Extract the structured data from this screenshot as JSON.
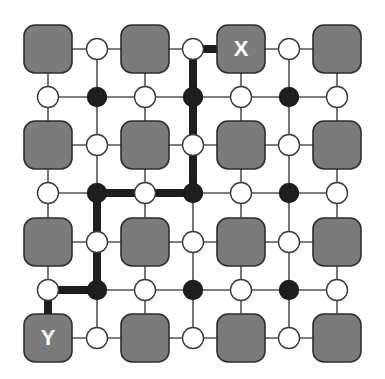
{
  "diagram": {
    "colors": {
      "background": "#ffffff",
      "block_fill": "#7b7b7b",
      "block_stroke": "#2e2e2e",
      "grid_line": "#555555",
      "path": "#1e1e1e",
      "node_white": "#ffffff",
      "node_black": "#1e1e1e",
      "label": "#ffffff"
    },
    "grid_x": [
      48,
      97,
      145,
      193,
      241,
      289,
      337
    ],
    "grid_y": [
      49,
      97,
      145,
      193,
      242,
      290,
      338
    ],
    "blocks": [
      {
        "col": 0,
        "row": 0,
        "label": ""
      },
      {
        "col": 2,
        "row": 0,
        "label": ""
      },
      {
        "col": 4,
        "row": 0,
        "label": "X"
      },
      {
        "col": 6,
        "row": 0,
        "label": ""
      },
      {
        "col": 0,
        "row": 2,
        "label": ""
      },
      {
        "col": 2,
        "row": 2,
        "label": ""
      },
      {
        "col": 4,
        "row": 2,
        "label": ""
      },
      {
        "col": 6,
        "row": 2,
        "label": ""
      },
      {
        "col": 0,
        "row": 4,
        "label": ""
      },
      {
        "col": 2,
        "row": 4,
        "label": ""
      },
      {
        "col": 4,
        "row": 4,
        "label": ""
      },
      {
        "col": 6,
        "row": 4,
        "label": ""
      },
      {
        "col": 0,
        "row": 6,
        "label": "Y"
      },
      {
        "col": 2,
        "row": 6,
        "label": ""
      },
      {
        "col": 4,
        "row": 6,
        "label": ""
      },
      {
        "col": 6,
        "row": 6,
        "label": ""
      }
    ],
    "labels": {
      "source": "X",
      "target": "Y"
    },
    "nodes": [
      {
        "col": 1,
        "row": 0,
        "type": "white"
      },
      {
        "col": 3,
        "row": 0,
        "type": "white"
      },
      {
        "col": 5,
        "row": 0,
        "type": "white"
      },
      {
        "col": 0,
        "row": 1,
        "type": "white"
      },
      {
        "col": 1,
        "row": 1,
        "type": "black"
      },
      {
        "col": 2,
        "row": 1,
        "type": "white"
      },
      {
        "col": 3,
        "row": 1,
        "type": "black"
      },
      {
        "col": 4,
        "row": 1,
        "type": "white"
      },
      {
        "col": 5,
        "row": 1,
        "type": "black"
      },
      {
        "col": 6,
        "row": 1,
        "type": "white"
      },
      {
        "col": 1,
        "row": 2,
        "type": "white"
      },
      {
        "col": 3,
        "row": 2,
        "type": "white"
      },
      {
        "col": 5,
        "row": 2,
        "type": "white"
      },
      {
        "col": 0,
        "row": 3,
        "type": "white"
      },
      {
        "col": 1,
        "row": 3,
        "type": "black"
      },
      {
        "col": 2,
        "row": 3,
        "type": "white"
      },
      {
        "col": 3,
        "row": 3,
        "type": "black"
      },
      {
        "col": 4,
        "row": 3,
        "type": "white"
      },
      {
        "col": 5,
        "row": 3,
        "type": "black"
      },
      {
        "col": 6,
        "row": 3,
        "type": "white"
      },
      {
        "col": 1,
        "row": 4,
        "type": "white"
      },
      {
        "col": 3,
        "row": 4,
        "type": "white"
      },
      {
        "col": 5,
        "row": 4,
        "type": "white"
      },
      {
        "col": 0,
        "row": 5,
        "type": "white"
      },
      {
        "col": 1,
        "row": 5,
        "type": "black"
      },
      {
        "col": 2,
        "row": 5,
        "type": "white"
      },
      {
        "col": 3,
        "row": 5,
        "type": "black"
      },
      {
        "col": 4,
        "row": 5,
        "type": "white"
      },
      {
        "col": 5,
        "row": 5,
        "type": "black"
      },
      {
        "col": 6,
        "row": 5,
        "type": "white"
      },
      {
        "col": 1,
        "row": 6,
        "type": "white"
      },
      {
        "col": 3,
        "row": 6,
        "type": "white"
      },
      {
        "col": 5,
        "row": 6,
        "type": "white"
      }
    ],
    "path": [
      [
        4,
        0
      ],
      [
        3,
        0
      ],
      [
        3,
        1
      ],
      [
        3,
        2
      ],
      [
        3,
        3
      ],
      [
        2,
        3
      ],
      [
        1,
        3
      ],
      [
        1,
        4
      ],
      [
        1,
        5
      ],
      [
        0,
        5
      ],
      [
        0,
        6
      ]
    ]
  }
}
